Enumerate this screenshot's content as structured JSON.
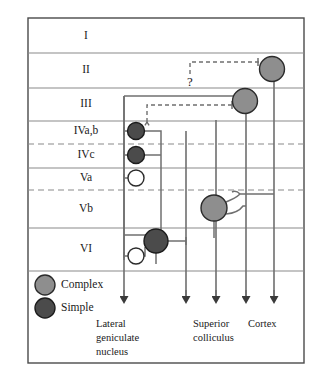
{
  "figure": {
    "frame": {
      "x": 28,
      "y": 18,
      "width": 276,
      "height": 345
    },
    "colors": {
      "complex_fill": "#8e8e8e",
      "simple_fill": "#4b4b4b",
      "open_fill": "#ffffff",
      "lamina_line": "#8a8a8a",
      "connection": "#6f6f6f",
      "frame": "#4a4a4a",
      "text": "#1a1a1a"
    }
  },
  "layers": [
    {
      "id": "I",
      "label": "I",
      "label_x": 86,
      "label_y": 36,
      "top": 18,
      "bottom": 53,
      "boundary_style": "solid"
    },
    {
      "id": "II",
      "label": "II",
      "label_x": 86,
      "label_y": 70,
      "top": 53,
      "bottom": 88,
      "boundary_style": "solid"
    },
    {
      "id": "III",
      "label": "III",
      "label_x": 86,
      "label_y": 104,
      "top": 88,
      "bottom": 121,
      "boundary_style": "solid"
    },
    {
      "id": "IVa,b",
      "label": "IVa,b",
      "label_x": 86,
      "label_y": 131,
      "top": 121,
      "bottom": 144,
      "boundary_style": "dashed"
    },
    {
      "id": "IVc",
      "label": "IVc",
      "label_x": 86,
      "label_y": 155,
      "top": 144,
      "bottom": 168,
      "boundary_style": "solid"
    },
    {
      "id": "Va",
      "label": "Va",
      "label_x": 86,
      "label_y": 178,
      "top": 168,
      "bottom": 190,
      "boundary_style": "dashed"
    },
    {
      "id": "Vb",
      "label": "Vb",
      "label_x": 86,
      "label_y": 209,
      "top": 190,
      "bottom": 228,
      "boundary_style": "solid"
    },
    {
      "id": "VI",
      "label": "VI",
      "label_x": 86,
      "label_y": 249,
      "top": 228,
      "bottom": 271,
      "boundary_style": "solid"
    }
  ],
  "legend": {
    "items": [
      {
        "key": "complex",
        "label": "Complex",
        "cx": 45,
        "cy": 285,
        "r": 10,
        "type": "complex",
        "text_x": 61,
        "text_y": 285
      },
      {
        "key": "simple",
        "label": "Simple",
        "cx": 45,
        "cy": 308,
        "r": 10,
        "type": "simple",
        "text_x": 61,
        "text_y": 308
      }
    ]
  },
  "cells": [
    {
      "id": "cell-complex-layer-ii",
      "type": "complex",
      "layer": "II",
      "cx": 272,
      "cy": 69,
      "r": 12.5
    },
    {
      "id": "cell-complex-layer-iii",
      "type": "complex",
      "layer": "III",
      "cx": 245,
      "cy": 101,
      "r": 12.5
    },
    {
      "id": "cell-simple-layer-ivab",
      "type": "simple",
      "layer": "IVa,b",
      "cx": 136,
      "cy": 131,
      "r": 8.5
    },
    {
      "id": "cell-simple-layer-ivc",
      "type": "simple",
      "layer": "IVc",
      "cx": 136,
      "cy": 155,
      "r": 8.5
    },
    {
      "id": "cell-open-layer-va",
      "type": "open",
      "layer": "Va",
      "cx": 136,
      "cy": 178,
      "r": 8
    },
    {
      "id": "cell-complex-layer-vb",
      "type": "complex",
      "layer": "Vb",
      "cx": 214,
      "cy": 208,
      "r": 13
    },
    {
      "id": "cell-simple-layer-vi",
      "type": "simple",
      "layer": "VI",
      "cx": 156,
      "cy": 241,
      "r": 12
    },
    {
      "id": "cell-open-layer-vi",
      "type": "open",
      "layer": "VI",
      "cx": 136,
      "cy": 256,
      "r": 8
    }
  ],
  "annotation": {
    "question_mark": "?",
    "question_x": 190,
    "question_y": 83
  },
  "projections": [
    {
      "id": "projection-lgn",
      "label": "Lateral\ngeniculate\nnucleus",
      "x": 124,
      "arrow_y": 303,
      "label_x": 96,
      "label_y": 325
    },
    {
      "id": "projection-sc",
      "label": "Superior\ncolliculus",
      "x": 186,
      "arrow_y": 303,
      "label_x": 193,
      "label_y": 325
    },
    {
      "id": "projection-mid",
      "label": "",
      "x": 216,
      "arrow_y": 303,
      "label_x": 0,
      "label_y": 0
    },
    {
      "id": "projection-cortex-1",
      "label": "Cortex",
      "x": 246,
      "arrow_y": 303,
      "label_x": 248,
      "label_y": 325
    },
    {
      "id": "projection-cortex-2",
      "label": "",
      "x": 274,
      "arrow_y": 303,
      "label_x": 0,
      "label_y": 0
    }
  ],
  "axis_labels": [
    {
      "id": "label-lgn-1",
      "text": "Lateral",
      "x": 96,
      "y": 325
    },
    {
      "id": "label-lgn-2",
      "text": "geniculate",
      "x": 96,
      "y": 339
    },
    {
      "id": "label-lgn-3",
      "text": "nucleus",
      "x": 96,
      "y": 353
    },
    {
      "id": "label-sc-1",
      "text": "Superior",
      "x": 193,
      "y": 325
    },
    {
      "id": "label-sc-2",
      "text": "colliculus",
      "x": 193,
      "y": 339
    },
    {
      "id": "label-cortex-1",
      "text": "Cortex",
      "x": 248,
      "y": 325
    }
  ]
}
